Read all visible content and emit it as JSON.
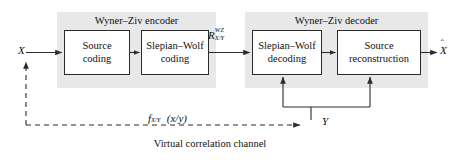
{
  "figure": {
    "caption": "Virtual correlation channel"
  },
  "panels": [
    {
      "id": "encoder",
      "title": "Wyner–Ziv encoder"
    },
    {
      "id": "decoder",
      "title": "Wyner–Ziv decoder"
    }
  ],
  "blocks": [
    {
      "id": "source-coding",
      "line1": "Source",
      "line2": "coding"
    },
    {
      "id": "slepian-wolf-coding",
      "line1": "Slepian–Wolf",
      "line2": "coding"
    },
    {
      "id": "slepian-wolf-decoding",
      "line1": "Slepian–Wolf",
      "line2": "decoding"
    },
    {
      "id": "source-reconstruction",
      "line1": "Source",
      "line2": "reconstruction"
    }
  ],
  "signals": {
    "input_x": "X",
    "output_xhat_base": "X",
    "output_xhat_accent": "ˆ",
    "side_info_y": "Y",
    "rate_base": "R",
    "rate_sup": "WZ",
    "rate_sub": "X/Y",
    "pdf_base": "f",
    "pdf_sub": "X/Y",
    "pdf_arg": "(x/y)"
  },
  "colors": {
    "panel_fill": "#e8e8e8",
    "block_stroke": "#2b2b2b",
    "block_fill": "#ffffff",
    "line": "#2b2b2b",
    "text": "#111111",
    "background": "#ffffff"
  }
}
